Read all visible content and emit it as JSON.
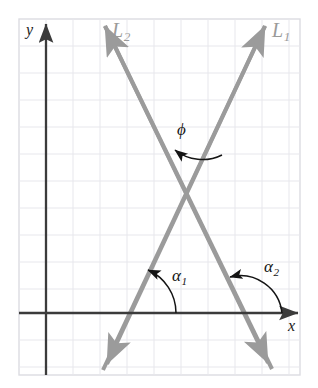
{
  "figure": {
    "kind": "geometry-diagram",
    "background": "#ffffff",
    "colors": {
      "grid_line": "#e6e6ea",
      "grid_border": "#dcdce2",
      "axis": "#3b3b3b",
      "ray_line": "#9b9b9b",
      "label_dark": "#141414",
      "label_gray": "#9a9a9a"
    },
    "grid": {
      "left": 19,
      "top": 19,
      "right": 300,
      "bottom": 375,
      "cell": 27,
      "x_positions": [
        19,
        46,
        73,
        100,
        127,
        154,
        181,
        208,
        235,
        262,
        289,
        300
      ],
      "y_positions": [
        19,
        46,
        73,
        100,
        127,
        154,
        181,
        208,
        235,
        262,
        289,
        313,
        340,
        367,
        375
      ]
    },
    "axes": {
      "x_axis": {
        "label": "x",
        "label_x": 288,
        "label_y": 318,
        "y_pixel": 313,
        "from_x": 19,
        "to_x": 303,
        "arrow": "right"
      },
      "y_axis": {
        "label": "y",
        "label_x": 26,
        "label_y": 22,
        "x_pixel": 46,
        "from_y": 375,
        "to_y": 17,
        "arrow": "up"
      }
    },
    "lines": [
      {
        "name": "L1",
        "label": "L",
        "subscript": "1",
        "label_x": 272,
        "label_y": 22,
        "slope_sign": "positive",
        "x_intercept_px": 129,
        "start": {
          "x": 103,
          "y": 370
        },
        "end": {
          "x": 265,
          "y": 22
        },
        "arrows": "both"
      },
      {
        "name": "L2",
        "label": "L",
        "subscript": "2",
        "label_x": 112,
        "label_y": 22,
        "slope_sign": "negative",
        "x_intercept_px": 240,
        "start": {
          "x": 104,
          "y": 22
        },
        "end": {
          "x": 272,
          "y": 373
        },
        "arrows": "both"
      }
    ],
    "intersection": {
      "x": 187,
      "y": 196
    },
    "angles": [
      {
        "name": "phi",
        "label": "ϕ",
        "label_x": 177,
        "label_y": 121,
        "arc_from": "L1-upper-right-ray",
        "arc_to": "L2-upper-left-ray",
        "arrow_at": "end",
        "vertex": {
          "x": 187,
          "y": 196
        }
      },
      {
        "name": "alpha1",
        "label": "α",
        "subscript": "1",
        "label_x": 172,
        "label_y": 267,
        "arc_from": "positive-x-direction",
        "arc_to": "L1-upward-ray",
        "arrow_at": "end",
        "vertex": {
          "x": 129,
          "y": 313
        }
      },
      {
        "name": "alpha2",
        "label": "α",
        "subscript": "2",
        "label_x": 264,
        "label_y": 258,
        "arc_from": "positive-x-direction",
        "arc_to": "L2-upward-left-ray",
        "arrow_at": "end",
        "vertex": {
          "x": 240,
          "y": 313
        }
      }
    ]
  }
}
